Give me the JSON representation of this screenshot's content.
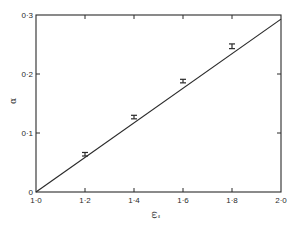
{
  "chart_data": {
    "type": "line",
    "title": "",
    "xlabel": "ω̃",
    "ylabel": "α",
    "xlim": [
      1.0,
      2.0
    ],
    "ylim": [
      0,
      0.3
    ],
    "grid": false,
    "legend": null,
    "x_ticks": [
      {
        "value": 1.0,
        "label": "1·0"
      },
      {
        "value": 1.2,
        "label": "1·2"
      },
      {
        "value": 1.4,
        "label": "1·4"
      },
      {
        "value": 1.6,
        "label": "1·6"
      },
      {
        "value": 1.8,
        "label": "1·8"
      },
      {
        "value": 2.0,
        "label": "2·0"
      }
    ],
    "y_ticks": [
      {
        "value": 0,
        "label": "0"
      },
      {
        "value": 0.1,
        "label": "0·1"
      },
      {
        "value": 0.2,
        "label": "0·2"
      },
      {
        "value": 0.3,
        "label": "0·3"
      }
    ],
    "series": [
      {
        "name": "fit line",
        "style": "line",
        "x": [
          1.0,
          2.0
        ],
        "y": [
          0.0,
          0.293
        ]
      },
      {
        "name": "measurements",
        "style": "errorbar",
        "x": [
          1.0,
          1.2,
          1.4,
          1.6,
          1.8
        ],
        "y": [
          0.0,
          0.064,
          0.127,
          0.188,
          0.247
        ],
        "err": [
          0.0,
          0.003,
          0.003,
          0.003,
          0.004
        ]
      }
    ]
  },
  "colors": {
    "ink": "#2a2a2a",
    "background": "#ffffff"
  }
}
